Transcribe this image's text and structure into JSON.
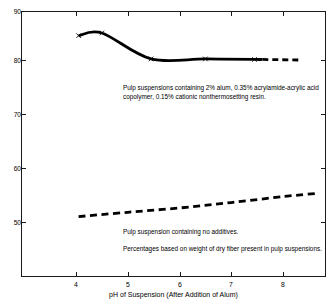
{
  "figure": {
    "clipped_header_text": "",
    "background_color": "#ffffff",
    "line_color": "#000000"
  },
  "chart_data": {
    "type": "line",
    "title": "",
    "xlabel": "pH of Suspension (After Addition of Alum)",
    "ylabel": "",
    "xlim": [
      3.35,
      8.85
    ],
    "ylim": [
      43.2,
      90.0
    ],
    "grid": false,
    "legend": "none",
    "xticks": [
      4,
      5,
      6,
      7,
      8
    ],
    "xtick_labels": [
      "4",
      "5",
      "6",
      "7",
      "8"
    ],
    "yticks": [
      50,
      60,
      70,
      80,
      90
    ],
    "ytick_labels": [
      "50",
      "60",
      "70",
      "80",
      "90"
    ],
    "series": [
      {
        "name": "Pulp suspensions containing 2% alum, 0.35% acrylamide-acrylic acid copolymer, 0.15% cationic nonthermosetting resin",
        "style": "solid-then-dashed",
        "marker": "x",
        "x": [
          4.05,
          4.5,
          5.45,
          6.5,
          7.45,
          7.6,
          8.3
        ],
        "y": [
          84.5,
          85.0,
          80.2,
          80.2,
          80.1,
          80.1,
          80.0
        ],
        "marker_points": [
          {
            "x": 4.05,
            "y": 84.5
          },
          {
            "x": 4.5,
            "y": 85.0
          },
          {
            "x": 5.45,
            "y": 80.2
          },
          {
            "x": 6.5,
            "y": 80.2
          },
          {
            "x": 7.45,
            "y": 80.1
          }
        ],
        "solid_until_x": 7.6,
        "dashed_from_x": 7.6
      },
      {
        "name": "Pulp suspension containing no additives",
        "style": "dashed",
        "marker": "none",
        "x": [
          4.05,
          5.0,
          6.0,
          7.0,
          8.0,
          8.65
        ],
        "y": [
          51.0,
          51.8,
          52.6,
          53.6,
          54.7,
          55.3
        ]
      }
    ],
    "annotations": [
      {
        "id": "upper-curve-note",
        "text": "Pulp suspensions containing 2% alum, 0.35% acrylamide-acrylic acid copolymer, 0.15% cationic nonthermosetting resin.",
        "near_series": "Pulp suspensions containing 2% alum, 0.35% acrylamide-acrylic acid copolymer, 0.15% cationic nonthermosetting resin"
      },
      {
        "id": "lower-curve-note",
        "text": "Pulp suspension containing no additives.",
        "near_series": "Pulp suspension containing no additives"
      },
      {
        "id": "basis-note",
        "text": "Percentages based on weight of dry fiber present in pulp suspensions.",
        "near_series": ""
      }
    ]
  },
  "axes": {
    "x_title": "pH of Suspension (After Addition of Alum)",
    "x_tick_labels": [
      "4",
      "5",
      "6",
      "7",
      "8"
    ],
    "y_tick_labels": [
      "90",
      "80",
      "70",
      "60",
      "50"
    ]
  },
  "annotations": {
    "upper": "Pulp suspensions containing 2% alum, 0.35% acrylamide-acrylic acid copolymer, 0.15% cationic nonthermosetting resin.",
    "lower_1": "Pulp suspension containing no additives.",
    "lower_2": "Percentages based on weight of dry fiber present in pulp suspensions."
  }
}
